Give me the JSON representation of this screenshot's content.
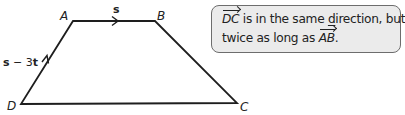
{
  "diagram": {
    "shape": "trapezium",
    "vertices": {
      "A": {
        "label": "A",
        "x": 73,
        "y": 21
      },
      "B": {
        "label": "B",
        "x": 155,
        "y": 21
      },
      "C": {
        "label": "C",
        "x": 237,
        "y": 103
      },
      "D": {
        "label": "D",
        "x": 21,
        "y": 104
      }
    },
    "edge_labels": {
      "AB": "s",
      "DA_part1": "s",
      "DA_minus": " − 3",
      "DA_part2": "t"
    },
    "colors": {
      "line": "#1e1e1e",
      "callout_bg": "#ebebeb",
      "callout_border": "#6d6d6d",
      "text": "#222222"
    }
  },
  "callout": {
    "vec1": "DC",
    "line1_rest_a": " is in the same ",
    "line1_underlined": "d",
    "line1_rest_b": "irection, but",
    "line2_start": "twice as long as ",
    "vec2": "AB",
    "line2_end": "."
  }
}
